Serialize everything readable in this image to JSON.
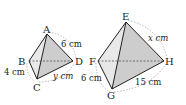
{
  "figure": {
    "left_tetrahedron": {
      "vertices": {
        "A": "A",
        "B": "B",
        "C": "C",
        "D": "D"
      },
      "edge_labels": {
        "AD": "6 cm",
        "BC": "4 cm",
        "CD": "y cm"
      }
    },
    "right_tetrahedron": {
      "vertices": {
        "E": "E",
        "F": "F",
        "G": "G",
        "H": "H"
      },
      "edge_labels": {
        "EH": "x cm",
        "FG": "6 cm",
        "GH": "15 cm"
      }
    },
    "colors": {
      "edge": "#231f20",
      "face_light": "#e6e6e6",
      "face_dark": "#cfcfcf",
      "dashed": "#8a8a8a"
    }
  }
}
